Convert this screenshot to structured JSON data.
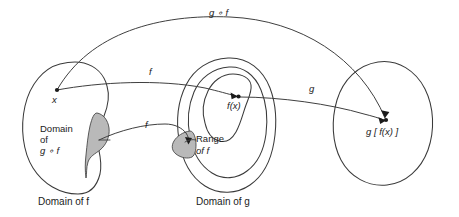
{
  "figure": {
    "type": "function-composition-diagram",
    "background_color": "#ffffff",
    "line_color": "#3a3a3a",
    "shade_color": "#b9b9b9"
  },
  "sets": {
    "left": {
      "caption": "Domain of f",
      "inner_label_line1": "Domain",
      "inner_label_line2": "of",
      "inner_label_line3": "g ∘ f",
      "subregion_name": "domain-of-composition-region"
    },
    "middle": {
      "caption": "Domain of g",
      "subregion_label_line1": "Range",
      "subregion_label_line2": "of f",
      "subregion_name": "range-of-f-region"
    },
    "right": {
      "caption": ""
    }
  },
  "points": {
    "x": "x",
    "fx": "f(x)",
    "gfx": "g [ f(x) ]"
  },
  "arrows": {
    "f_upper": "f",
    "f_lower": "f",
    "g": "g",
    "composition": "g ∘ f"
  }
}
